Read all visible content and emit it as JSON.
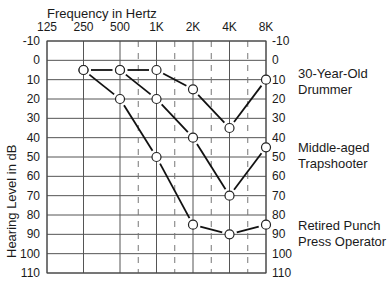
{
  "chart_data": {
    "type": "line",
    "title": "Frequency in Hertz",
    "xlabel": "Frequency in Hertz",
    "ylabel": "Hearing Level in dB",
    "x": [
      "125",
      "250",
      "500",
      "1K",
      "2K",
      "4K",
      "8K"
    ],
    "y_ticks": [
      "-10",
      "0",
      "10",
      "20",
      "30",
      "40",
      "50",
      "60",
      "70",
      "80",
      "90",
      "100",
      "110"
    ],
    "ylim": [
      -10,
      110
    ],
    "y_inverted": true,
    "grid": true,
    "legend_position": "right (inline labels)",
    "series": [
      {
        "name": "30-Year-Old Drummer",
        "x": [
          "250",
          "500",
          "1K",
          "2K",
          "4K",
          "8K"
        ],
        "values": [
          5,
          5,
          5,
          15,
          35,
          10
        ]
      },
      {
        "name": "Middle-aged Trapshooter",
        "x": [
          "500",
          "1K",
          "2K",
          "4K",
          "8K"
        ],
        "values": [
          5,
          20,
          40,
          70,
          45
        ]
      },
      {
        "name": "Retired Punch Press Operator",
        "x": [
          "250",
          "500",
          "1K",
          "2K",
          "4K",
          "8K"
        ],
        "values": [
          5,
          20,
          50,
          85,
          90,
          85
        ]
      }
    ]
  },
  "labels": {
    "title": "Frequency in Hertz",
    "ylabel": "Hearing Level in dB",
    "series": [
      {
        "line1": "30-Year-Old",
        "line2": "Drummer"
      },
      {
        "line1": "Middle-aged",
        "line2": "Trapshooter"
      },
      {
        "line1": "Retired Punch",
        "line2": "Press Operator"
      }
    ]
  }
}
